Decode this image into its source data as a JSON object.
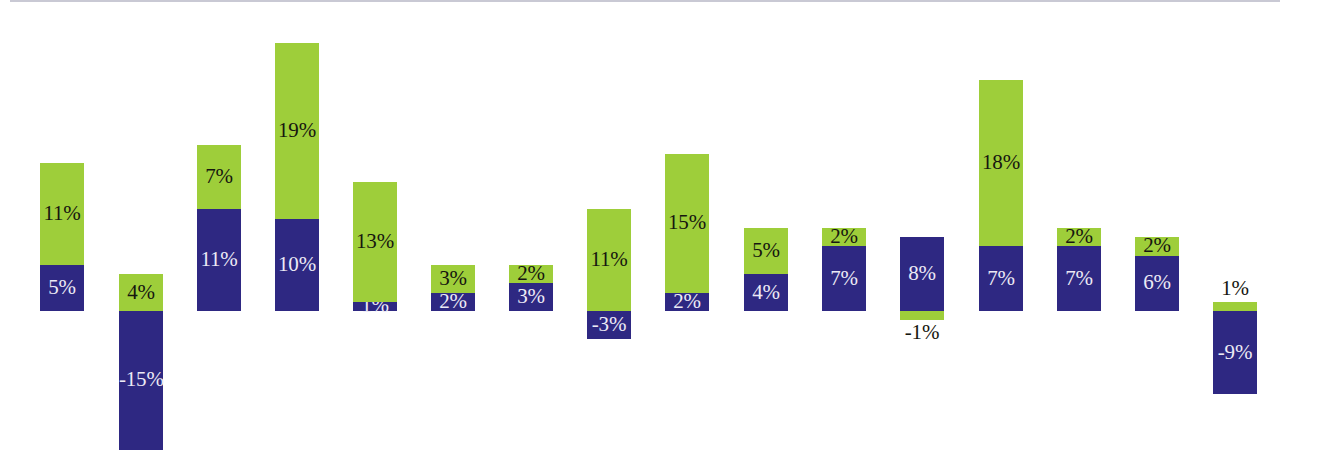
{
  "chart": {
    "title": "",
    "axis_color": "#c9c9d4",
    "background": "#ffffff"
  },
  "chart_data": {
    "type": "bar",
    "subtype": "stacked-diverging",
    "title": "",
    "xlabel": "",
    "ylabel": "",
    "grid": false,
    "legend": "none",
    "ylim": [
      -16,
      30
    ],
    "axis_baseline": 0,
    "unit": "%",
    "categories": [
      "1",
      "2",
      "3",
      "4",
      "5",
      "6",
      "7",
      "8",
      "9",
      "10",
      "11",
      "12",
      "13",
      "14",
      "15",
      "16"
    ],
    "series": [
      {
        "name": "green",
        "color": "#9ece3a",
        "values": [
          11,
          4,
          7,
          19,
          13,
          3,
          2,
          11,
          15,
          5,
          2,
          -1,
          18,
          2,
          2,
          1
        ]
      },
      {
        "name": "purple",
        "color": "#2e2882",
        "values": [
          5,
          -15,
          11,
          10,
          1,
          2,
          3,
          -3,
          2,
          4,
          7,
          8,
          7,
          7,
          6,
          -9
        ]
      }
    ],
    "bars": [
      {
        "index": 1,
        "x": 40,
        "width": 44,
        "segments": [
          {
            "series": "green",
            "value": 11,
            "label": "11%",
            "label_pos": "inside",
            "label_color": "dark"
          },
          {
            "series": "purple",
            "value": 5,
            "label": "5%",
            "label_pos": "inside",
            "label_color": "light"
          }
        ]
      },
      {
        "index": 2,
        "x": 119,
        "width": 44,
        "segments": [
          {
            "series": "green",
            "value": 4,
            "label": "4%",
            "label_pos": "inside",
            "label_color": "dark"
          },
          {
            "series": "purple",
            "value": -15,
            "label": "-15%",
            "label_pos": "inside",
            "label_color": "light"
          }
        ]
      },
      {
        "index": 3,
        "x": 197,
        "width": 44,
        "segments": [
          {
            "series": "green",
            "value": 7,
            "label": "7%",
            "label_pos": "inside",
            "label_color": "dark"
          },
          {
            "series": "purple",
            "value": 11,
            "label": "11%",
            "label_pos": "inside",
            "label_color": "light"
          }
        ]
      },
      {
        "index": 4,
        "x": 275,
        "width": 44,
        "segments": [
          {
            "series": "green",
            "value": 19,
            "label": "19%",
            "label_pos": "inside",
            "label_color": "dark"
          },
          {
            "series": "purple",
            "value": 10,
            "label": "10%",
            "label_pos": "inside",
            "label_color": "light"
          }
        ]
      },
      {
        "index": 5,
        "x": 353,
        "width": 44,
        "segments": [
          {
            "series": "green",
            "value": 13,
            "label": "13%",
            "label_pos": "inside",
            "label_color": "dark"
          },
          {
            "series": "purple",
            "value": 1,
            "label": "1%",
            "label_pos": "inside",
            "label_color": "light"
          }
        ]
      },
      {
        "index": 6,
        "x": 431,
        "width": 44,
        "segments": [
          {
            "series": "green",
            "value": 3,
            "label": "3%",
            "label_pos": "inside",
            "label_color": "dark"
          },
          {
            "series": "purple",
            "value": 2,
            "label": "2%",
            "label_pos": "inside",
            "label_color": "light"
          }
        ]
      },
      {
        "index": 7,
        "x": 509,
        "width": 44,
        "segments": [
          {
            "series": "green",
            "value": 2,
            "label": "2%",
            "label_pos": "inside",
            "label_color": "dark"
          },
          {
            "series": "purple",
            "value": 3,
            "label": "3%",
            "label_pos": "inside",
            "label_color": "light"
          }
        ]
      },
      {
        "index": 8,
        "x": 587,
        "width": 44,
        "segments": [
          {
            "series": "green",
            "value": 11,
            "label": "11%",
            "label_pos": "inside",
            "label_color": "dark"
          },
          {
            "series": "purple",
            "value": -3,
            "label": "-3%",
            "label_pos": "inside",
            "label_color": "light"
          }
        ]
      },
      {
        "index": 9,
        "x": 665,
        "width": 44,
        "segments": [
          {
            "series": "green",
            "value": 15,
            "label": "15%",
            "label_pos": "inside",
            "label_color": "dark"
          },
          {
            "series": "purple",
            "value": 2,
            "label": "2%",
            "label_pos": "inside",
            "label_color": "light"
          }
        ]
      },
      {
        "index": 10,
        "x": 744,
        "width": 44,
        "segments": [
          {
            "series": "green",
            "value": 5,
            "label": "5%",
            "label_pos": "inside",
            "label_color": "dark"
          },
          {
            "series": "purple",
            "value": 4,
            "label": "4%",
            "label_pos": "inside",
            "label_color": "light"
          }
        ]
      },
      {
        "index": 11,
        "x": 822,
        "width": 44,
        "segments": [
          {
            "series": "green",
            "value": 2,
            "label": "2%",
            "label_pos": "inside",
            "label_color": "dark"
          },
          {
            "series": "purple",
            "value": 7,
            "label": "7%",
            "label_pos": "inside",
            "label_color": "light"
          }
        ]
      },
      {
        "index": 12,
        "x": 900,
        "width": 44,
        "segments": [
          {
            "series": "green",
            "value": -1,
            "label": "-1%",
            "label_pos": "below",
            "label_color": "dark"
          },
          {
            "series": "purple",
            "value": 8,
            "label": "8%",
            "label_pos": "inside",
            "label_color": "light"
          }
        ]
      },
      {
        "index": 13,
        "x": 979,
        "width": 44,
        "segments": [
          {
            "series": "green",
            "value": 18,
            "label": "18%",
            "label_pos": "inside",
            "label_color": "dark"
          },
          {
            "series": "purple",
            "value": 7,
            "label": "7%",
            "label_pos": "inside",
            "label_color": "light"
          }
        ]
      },
      {
        "index": 14,
        "x": 1057,
        "width": 44,
        "segments": [
          {
            "series": "green",
            "value": 2,
            "label": "2%",
            "label_pos": "inside",
            "label_color": "dark"
          },
          {
            "series": "purple",
            "value": 7,
            "label": "7%",
            "label_pos": "inside",
            "label_color": "light"
          }
        ]
      },
      {
        "index": 15,
        "x": 1135,
        "width": 44,
        "segments": [
          {
            "series": "green",
            "value": 2,
            "label": "2%",
            "label_pos": "inside",
            "label_color": "dark"
          },
          {
            "series": "purple",
            "value": 6,
            "label": "6%",
            "label_pos": "inside",
            "label_color": "light"
          }
        ]
      },
      {
        "index": 16,
        "x": 1213,
        "width": 44,
        "segments": [
          {
            "series": "green",
            "value": 1,
            "label": "1%",
            "label_pos": "above",
            "label_color": "dark"
          },
          {
            "series": "purple",
            "value": -9,
            "label": "-9%",
            "label_pos": "inside",
            "label_color": "light"
          }
        ]
      }
    ]
  }
}
